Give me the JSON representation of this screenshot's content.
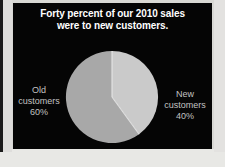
{
  "slide": {
    "background_color": "#050505",
    "title_line1": "Forty percent of our 2010 sales",
    "title_line2": "were to new customers.",
    "title_color": "#ffffff"
  },
  "labels": {
    "left": {
      "line1": "Old",
      "line2": "customers",
      "line3": "60%"
    },
    "right": {
      "line1": "New",
      "line2": "customers",
      "line3": "40%"
    },
    "color": "#c2c2c2"
  },
  "chart_data": {
    "type": "pie",
    "title": "Forty percent of our 2010 sales were to new customers.",
    "categories": [
      "New customers",
      "Old customers"
    ],
    "values": [
      40,
      60
    ],
    "value_labels": [
      "40%",
      "60%"
    ],
    "colors": [
      "#cacaca",
      "#a8a8a8"
    ],
    "start_angle_deg": 0,
    "direction": "clockwise",
    "legend": "outside-labels",
    "grid": false,
    "background": "#050505"
  }
}
